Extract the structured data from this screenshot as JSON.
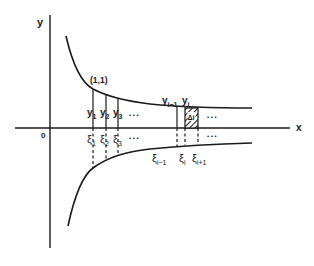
{
  "figure": {
    "axes": {
      "x_label": "x",
      "y_label": "y",
      "origin_label": "0"
    },
    "point_label": "(1,1)",
    "upper_ordinates": [
      {
        "name": "y",
        "sub": "1"
      },
      {
        "name": "y",
        "sub": "2"
      },
      {
        "name": "y",
        "sub": "3"
      },
      {
        "name": "y",
        "sub": "i−1"
      },
      {
        "name": "y",
        "sub": "i"
      }
    ],
    "lower_points": [
      {
        "name": "ξ",
        "sub": "1"
      },
      {
        "name": "ξ",
        "sub": "2"
      },
      {
        "name": "ξ",
        "sub": "3"
      },
      {
        "name": "ξ",
        "sub": "i−1"
      },
      {
        "name": "ξ",
        "sub": "i"
      },
      {
        "name": "ξ",
        "sub": "i+1"
      }
    ],
    "shaded_cell_label": "Δi",
    "ellipsis": "• • •"
  }
}
